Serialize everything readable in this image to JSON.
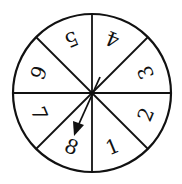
{
  "spinner": {
    "sections": [
      "1",
      "2",
      "3",
      "4",
      "5",
      "6",
      "7",
      "8"
    ],
    "arrow_points_to": "8",
    "stroke_color": "#111111",
    "background": "#ffffff"
  }
}
